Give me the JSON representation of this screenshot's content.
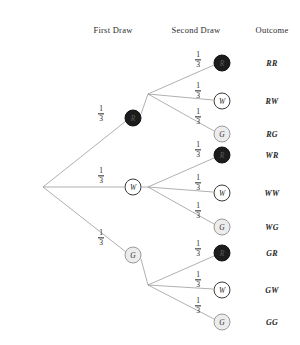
{
  "diagram": {
    "headers": [
      {
        "label": "First Draw",
        "x": 113,
        "y": 30
      },
      {
        "label": "Second Draw",
        "x": 196,
        "y": 30
      },
      {
        "label": "Outcome",
        "x": 272,
        "y": 30
      }
    ],
    "root": {
      "x": 43,
      "y": 187
    },
    "junctions": [
      {
        "name": "second-draw-junction-r",
        "x": 148,
        "y": 94
      },
      {
        "name": "second-draw-junction-w",
        "x": 148,
        "y": 187
      },
      {
        "name": "second-draw-junction-g",
        "x": 148,
        "y": 285
      }
    ],
    "first_draw_nodes": [
      {
        "letter": "R",
        "kind": "red",
        "x": 133,
        "y": 118
      },
      {
        "letter": "W",
        "kind": "white",
        "x": 133,
        "y": 187
      },
      {
        "letter": "G",
        "kind": "green",
        "x": 133,
        "y": 255
      }
    ],
    "second_draw_nodes": [
      {
        "letter": "R",
        "kind": "red",
        "x": 222,
        "y": 63
      },
      {
        "letter": "W",
        "kind": "white",
        "x": 222,
        "y": 101
      },
      {
        "letter": "G",
        "kind": "green",
        "x": 222,
        "y": 134
      },
      {
        "letter": "R",
        "kind": "red",
        "x": 222,
        "y": 155
      },
      {
        "letter": "W",
        "kind": "white",
        "x": 222,
        "y": 193
      },
      {
        "letter": "G",
        "kind": "green",
        "x": 222,
        "y": 227
      },
      {
        "letter": "R",
        "kind": "red",
        "x": 222,
        "y": 253
      },
      {
        "letter": "W",
        "kind": "white",
        "x": 222,
        "y": 290
      },
      {
        "letter": "G",
        "kind": "green",
        "x": 222,
        "y": 322
      }
    ],
    "first_draw_probabilities": [
      {
        "numerator": "1",
        "denominator": "3",
        "x": 101,
        "y": 114
      },
      {
        "numerator": "1",
        "denominator": "3",
        "x": 101,
        "y": 176
      },
      {
        "numerator": "1",
        "denominator": "3",
        "x": 101,
        "y": 238
      }
    ],
    "second_draw_probabilities": [
      {
        "numerator": "1",
        "denominator": "3",
        "x": 198,
        "y": 60
      },
      {
        "numerator": "1",
        "denominator": "3",
        "x": 198,
        "y": 91
      },
      {
        "numerator": "1",
        "denominator": "3",
        "x": 198,
        "y": 117
      },
      {
        "numerator": "1",
        "denominator": "3",
        "x": 198,
        "y": 150
      },
      {
        "numerator": "1",
        "denominator": "3",
        "x": 198,
        "y": 183
      },
      {
        "numerator": "1",
        "denominator": "3",
        "x": 198,
        "y": 211
      },
      {
        "numerator": "1",
        "denominator": "3",
        "x": 198,
        "y": 249
      },
      {
        "numerator": "1",
        "denominator": "3",
        "x": 198,
        "y": 280
      },
      {
        "numerator": "1",
        "denominator": "3",
        "x": 198,
        "y": 306
      }
    ],
    "outcomes": [
      {
        "label": "RR",
        "x": 272,
        "y": 63
      },
      {
        "label": "RW",
        "x": 272,
        "y": 101
      },
      {
        "label": "RG",
        "x": 272,
        "y": 134
      },
      {
        "label": "WR",
        "x": 272,
        "y": 155
      },
      {
        "label": "WW",
        "x": 272,
        "y": 193
      },
      {
        "label": "WG",
        "x": 272,
        "y": 227
      },
      {
        "label": "GR",
        "x": 272,
        "y": 253
      },
      {
        "label": "GW",
        "x": 272,
        "y": 290
      },
      {
        "label": "GG",
        "x": 272,
        "y": 322
      }
    ],
    "edges": [
      {
        "name": "edge-root-to-r",
        "x1": 43,
        "y1": 187,
        "x2": 126,
        "y2": 121
      },
      {
        "name": "edge-root-to-w",
        "x1": 43,
        "y1": 187,
        "x2": 124,
        "y2": 187
      },
      {
        "name": "edge-root-to-g",
        "x1": 43,
        "y1": 187,
        "x2": 126,
        "y2": 252
      },
      {
        "name": "edge-r-to-junction",
        "x1": 141,
        "y1": 114,
        "x2": 148,
        "y2": 94
      },
      {
        "name": "edge-w-to-junction",
        "x1": 142,
        "y1": 187,
        "x2": 148,
        "y2": 187
      },
      {
        "name": "edge-g-to-junction",
        "x1": 141,
        "y1": 259,
        "x2": 148,
        "y2": 285
      },
      {
        "name": "edge-rj-to-rr",
        "x1": 148,
        "y1": 94,
        "x2": 214,
        "y2": 65
      },
      {
        "name": "edge-rj-to-rw",
        "x1": 148,
        "y1": 94,
        "x2": 213,
        "y2": 100
      },
      {
        "name": "edge-rj-to-rg",
        "x1": 148,
        "y1": 94,
        "x2": 214,
        "y2": 131
      },
      {
        "name": "edge-wj-to-wr",
        "x1": 148,
        "y1": 187,
        "x2": 214,
        "y2": 158
      },
      {
        "name": "edge-wj-to-ww",
        "x1": 148,
        "y1": 187,
        "x2": 213,
        "y2": 192
      },
      {
        "name": "edge-wj-to-wg",
        "x1": 148,
        "y1": 187,
        "x2": 214,
        "y2": 224
      },
      {
        "name": "edge-gj-to-gr",
        "x1": 148,
        "y1": 285,
        "x2": 214,
        "y2": 256
      },
      {
        "name": "edge-gj-to-gw",
        "x1": 148,
        "y1": 285,
        "x2": 213,
        "y2": 289
      },
      {
        "name": "edge-gj-to-gg",
        "x1": 148,
        "y1": 285,
        "x2": 214,
        "y2": 319
      }
    ]
  }
}
